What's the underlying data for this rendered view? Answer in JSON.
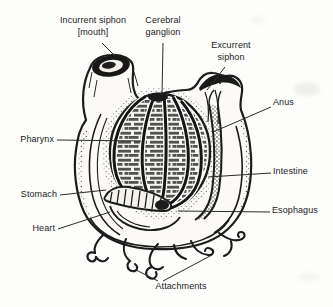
{
  "figure": {
    "labels": {
      "incurrent_siphon": "Incurrent siphon\n[mouth]",
      "cerebral_ganglion": "Cerebral\nganglion",
      "excurrent_siphon": "Excurrent\nsiphon",
      "anus": "Anus",
      "pharynx": "Pharynx",
      "intestine": "Intestine",
      "stomach": "Stomach",
      "esophagus": "Esophagus",
      "heart": "Heart",
      "attachments": "Attachments"
    },
    "colors": {
      "ink": "#1c1c1c",
      "paper": "#fdfdfb"
    }
  }
}
